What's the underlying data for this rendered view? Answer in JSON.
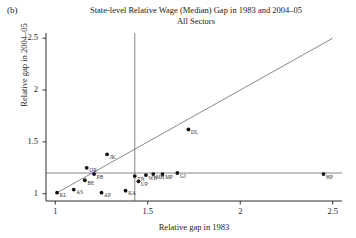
{
  "panel": {
    "label": "(b)"
  },
  "title": {
    "line1": "State-level Relative Wage (Median) Gap in 1983 and 2004–05",
    "line2": "All Sectors"
  },
  "axes": {
    "xlabel": "Relative gap in 1983",
    "ylabel": "Relative gap in 2004–05",
    "xticks": [
      "1",
      "1.5",
      "2",
      "2.5"
    ],
    "yticks": [
      "1",
      "1.5",
      "2",
      "2.5"
    ]
  },
  "chart_data": {
    "type": "scatter",
    "xlabel": "Relative gap in 1983",
    "ylabel": "Relative gap in 2004–05",
    "xlim": [
      0.95,
      2.55
    ],
    "ylim": [
      0.93,
      2.55
    ],
    "xticks": [
      1,
      1.5,
      2,
      2.5
    ],
    "yticks": [
      1,
      1.5,
      2,
      2.5
    ],
    "grid": false,
    "legend": null,
    "marker": "filled-circle",
    "marker_color": "#111111",
    "reference_lines": [
      {
        "name": "identity-line",
        "type": "diagonal",
        "equation": "y = x",
        "from": [
          1.0,
          1.0
        ],
        "to": [
          2.5,
          2.5
        ]
      },
      {
        "name": "vertical-reference",
        "type": "vertical",
        "x": 1.43
      },
      {
        "name": "horizontal-reference",
        "type": "horizontal",
        "y": 1.2
      }
    ],
    "points": [
      {
        "label": "KL",
        "x": 1.01,
        "y": 1.01
      },
      {
        "label": "AS",
        "x": 1.1,
        "y": 1.04
      },
      {
        "label": "BE",
        "x": 1.16,
        "y": 1.13
      },
      {
        "label": "OR",
        "x": 1.17,
        "y": 1.25
      },
      {
        "label": "PB",
        "x": 1.21,
        "y": 1.19
      },
      {
        "label": "AP",
        "x": 1.25,
        "y": 1.01
      },
      {
        "label": "JK",
        "x": 1.28,
        "y": 1.38
      },
      {
        "label": "KA",
        "x": 1.38,
        "y": 1.03
      },
      {
        "label": "TN",
        "x": 1.43,
        "y": 1.17
      },
      {
        "label": "UP",
        "x": 1.45,
        "y": 1.12
      },
      {
        "label": "WB",
        "x": 1.49,
        "y": 1.18
      },
      {
        "label": "MH",
        "x": 1.53,
        "y": 1.19
      },
      {
        "label": "MP",
        "x": 1.58,
        "y": 1.19
      },
      {
        "label": "GJ",
        "x": 1.66,
        "y": 1.2
      },
      {
        "label": "DL",
        "x": 1.72,
        "y": 1.62
      },
      {
        "label": "HP",
        "x": 2.45,
        "y": 1.19
      }
    ]
  }
}
